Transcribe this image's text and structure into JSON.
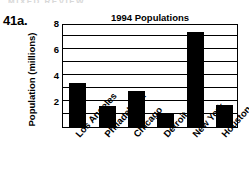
{
  "page": {
    "running_header": "MIXED REVIEW",
    "item_number": "41a."
  },
  "chart_data": {
    "type": "bar",
    "title": "1994 Populations",
    "xlabel": "",
    "ylabel": "Population (millions)",
    "categories": [
      "Los Angeles",
      "Philadelphia",
      "Chicago",
      "Detroit",
      "New York",
      "Houston"
    ],
    "values": [
      3.4,
      1.6,
      2.8,
      1.0,
      7.3,
      1.7
    ],
    "ylim": [
      0,
      8
    ],
    "y_tick_labels": [
      "8",
      "6",
      "4",
      "2"
    ],
    "y_tick_values": [
      8,
      6,
      4,
      2
    ],
    "gridline_values": [
      1,
      2,
      3,
      4,
      5,
      6,
      7
    ],
    "grid": true,
    "legend": "none",
    "bar_color": "#000000"
  }
}
